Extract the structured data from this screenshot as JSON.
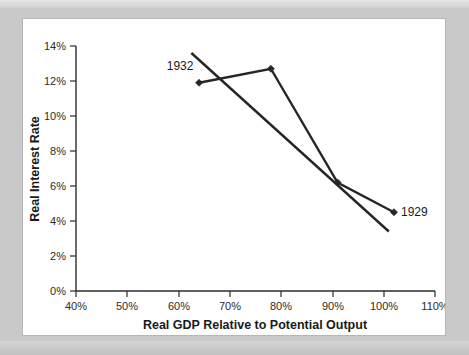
{
  "chart_data": {
    "type": "line",
    "title": "",
    "xlabel": "Real GDP Relative to Potential Output",
    "ylabel": "Real Interest Rate",
    "xlim": [
      40,
      110
    ],
    "ylim": [
      0,
      14
    ],
    "grid": false,
    "legend": "none",
    "xticks": [
      "40%",
      "50%",
      "60%",
      "70%",
      "80%",
      "90%",
      "100%",
      "110%"
    ],
    "xtick_values": [
      40,
      50,
      60,
      70,
      80,
      90,
      100,
      110
    ],
    "yticks": [
      "0%",
      "2%",
      "4%",
      "6%",
      "8%",
      "10%",
      "12%",
      "14%"
    ],
    "ytick_values": [
      0,
      2,
      4,
      6,
      8,
      10,
      12,
      14
    ],
    "series": [
      {
        "name": "Observed path",
        "x": [
          64,
          78,
          91,
          102
        ],
        "y": [
          11.9,
          12.7,
          6.2,
          4.5
        ],
        "markers": true
      },
      {
        "name": "Trend line",
        "x": [
          62.5,
          101
        ],
        "y": [
          13.6,
          3.4
        ],
        "markers": false
      }
    ],
    "annotations": [
      {
        "text": "1932",
        "x": 64,
        "y": 11.9,
        "anchor": "above-left"
      },
      {
        "text": "1929",
        "x": 102,
        "y": 4.5,
        "anchor": "right"
      }
    ],
    "colors": {
      "line": "#262626",
      "axis": "#2b2b2b",
      "panel_background": "#ffffff",
      "figure_background": "#c9c9c9",
      "panel_border": "#b6b6b6",
      "text": "#1a1a1a"
    }
  }
}
